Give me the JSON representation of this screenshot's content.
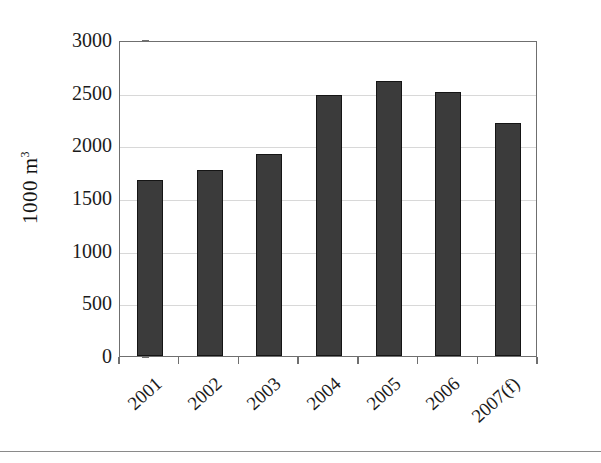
{
  "chart_data": {
    "type": "bar",
    "title": "",
    "subtitle": "",
    "xlabel": "",
    "ylabel": "1000 m",
    "ylabel_sup": "3",
    "categories": [
      "2001",
      "2002",
      "2003",
      "2004",
      "2005",
      "2006",
      "2007(f)"
    ],
    "values": [
      1670,
      1770,
      1920,
      2480,
      2610,
      2510,
      2210
    ],
    "series": [
      {
        "name": "Volume",
        "values": [
          1670,
          1770,
          1920,
          2480,
          2610,
          2510,
          2210
        ]
      }
    ],
    "ylim": [
      0,
      3000
    ],
    "ytick_labels": [
      "0",
      "500",
      "1000",
      "1500",
      "2000",
      "2500",
      "3000"
    ],
    "ytick_values": [
      0,
      500,
      1000,
      1500,
      2000,
      2500,
      3000
    ],
    "grid": "horizontal",
    "legend": "none",
    "bar_color": "#3b3b3b",
    "bar_border_color": "#151515",
    "gridline_color": "#d8d8d8",
    "axis_color": "#6f6f6f",
    "background": "#ffffff",
    "annotations": []
  }
}
